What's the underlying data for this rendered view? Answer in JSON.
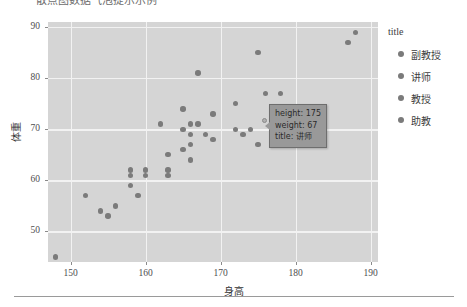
{
  "page": {
    "clipped_heading": "散点图数据气泡提示示例",
    "background_color": "#ffffff"
  },
  "chart_data": {
    "type": "scatter",
    "title": "",
    "xlabel": "身高",
    "ylabel": "体重",
    "xlim": [
      147,
      191
    ],
    "ylim": [
      44,
      91
    ],
    "xticks": [
      150,
      160,
      170,
      180,
      190
    ],
    "yticks": [
      50,
      60,
      70,
      80,
      90
    ],
    "grid": true,
    "panel_color": "#d5d5d5",
    "grid_color": "#f2f2f2",
    "point_color": "#7b7b7b",
    "legend": {
      "title": "title",
      "position": "right",
      "entries": [
        "副教授",
        "讲师",
        "教授",
        "助教"
      ]
    },
    "points": [
      {
        "x": 148,
        "y": 45
      },
      {
        "x": 152,
        "y": 57
      },
      {
        "x": 154,
        "y": 54
      },
      {
        "x": 155,
        "y": 53
      },
      {
        "x": 156,
        "y": 55
      },
      {
        "x": 158,
        "y": 59
      },
      {
        "x": 158,
        "y": 61
      },
      {
        "x": 158,
        "y": 62
      },
      {
        "x": 159,
        "y": 57
      },
      {
        "x": 160,
        "y": 61
      },
      {
        "x": 160,
        "y": 62
      },
      {
        "x": 162,
        "y": 71
      },
      {
        "x": 163,
        "y": 61
      },
      {
        "x": 163,
        "y": 62
      },
      {
        "x": 163,
        "y": 65
      },
      {
        "x": 165,
        "y": 70
      },
      {
        "x": 165,
        "y": 74
      },
      {
        "x": 165,
        "y": 66
      },
      {
        "x": 166,
        "y": 71
      },
      {
        "x": 166,
        "y": 69
      },
      {
        "x": 166,
        "y": 67
      },
      {
        "x": 166,
        "y": 64
      },
      {
        "x": 167,
        "y": 71
      },
      {
        "x": 167,
        "y": 81
      },
      {
        "x": 168,
        "y": 69
      },
      {
        "x": 169,
        "y": 73
      },
      {
        "x": 169,
        "y": 68
      },
      {
        "x": 172,
        "y": 75
      },
      {
        "x": 172,
        "y": 70
      },
      {
        "x": 173,
        "y": 69
      },
      {
        "x": 174,
        "y": 70
      },
      {
        "x": 175,
        "y": 85
      },
      {
        "x": 175,
        "y": 67
      },
      {
        "x": 176,
        "y": 77
      },
      {
        "x": 177,
        "y": 74
      },
      {
        "x": 178,
        "y": 77
      },
      {
        "x": 187,
        "y": 87
      },
      {
        "x": 188,
        "y": 89
      }
    ]
  },
  "tooltip": {
    "line1": "height: 175",
    "line2": "weight: 67",
    "line3": "title: 讲师",
    "background_color": "#999999",
    "border_color": "#6e6e6e"
  }
}
